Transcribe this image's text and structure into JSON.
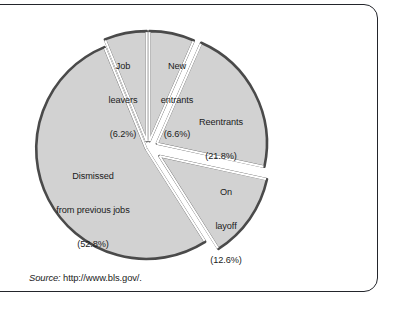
{
  "figure": {
    "frame_border_color": "#23252b",
    "background_color": "#ffffff"
  },
  "source": {
    "prefix": "Source:",
    "url": " http://www.bls.gov/."
  },
  "chart_data": {
    "type": "pie",
    "title": "",
    "subtitle": "",
    "xlabel": "",
    "ylabel": "",
    "legend_position": "none",
    "grid": false,
    "exploded": true,
    "units": "percent",
    "fill_color": "#d2d2d2",
    "edge_color": "#4a4a4a",
    "gap_color": "#ffffff",
    "categories": [
      "New entrants",
      "Reentrants",
      "On layoff",
      "Dismissed from previous jobs",
      "Job leavers"
    ],
    "values": [
      6.6,
      21.8,
      12.6,
      52.8,
      6.2
    ],
    "slices": [
      {
        "name": "new-entrants",
        "label_line1": "New",
        "label_line2": "entrants",
        "label_value": "(6.6%)",
        "value": 6.6
      },
      {
        "name": "reentrants",
        "label_line1": "Reentrants",
        "label_line2": "",
        "label_value": "(21.8%)",
        "value": 21.8
      },
      {
        "name": "on-layoff",
        "label_line1": "On",
        "label_line2": "layoff",
        "label_value": "(12.6%)",
        "value": 12.6
      },
      {
        "name": "dismissed-from-previous-jobs",
        "label_line1": "Dismissed",
        "label_line2": "from previous jobs",
        "label_value": "(52.8%)",
        "value": 52.8
      },
      {
        "name": "job-leavers",
        "label_line1": "Job",
        "label_line2": "leavers",
        "label_value": "(6.2%)",
        "value": 6.2
      }
    ]
  }
}
